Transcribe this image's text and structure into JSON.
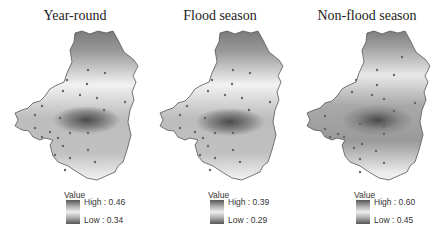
{
  "panels": [
    {
      "title": "Year-round",
      "legend": {
        "title": "Value",
        "high": "High : 0.46",
        "low": "Low : 0.34"
      }
    },
    {
      "title": "Flood season",
      "legend": {
        "title": "Value",
        "high": "High : 0.39",
        "low": "Low : 0.29"
      }
    },
    {
      "title": "Non-flood season",
      "legend": {
        "title": "Value",
        "high": "High : 0.60",
        "low": "Low : 0.45"
      }
    }
  ],
  "colors": {
    "dark": "#4a4a4a",
    "light": "#f2f2f2",
    "outline": "#555555",
    "point": "#555555"
  }
}
